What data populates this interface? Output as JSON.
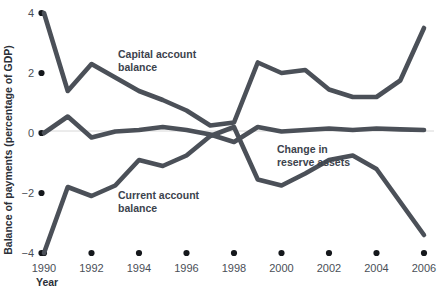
{
  "chart_data": {
    "type": "line",
    "title": "",
    "xlabel": "Year",
    "ylabel": "Balance of payments (percentage of GDP)",
    "xlim": [
      1990,
      2006
    ],
    "ylim": [
      -4,
      4
    ],
    "ytick_labels": [
      "4",
      "2",
      "0",
      "−2",
      "−4"
    ],
    "ytick_values": [
      4,
      2,
      0,
      -2,
      -4
    ],
    "xtick_labels": [
      "1990",
      "1992",
      "1994",
      "1996",
      "1998",
      "2000",
      "2002",
      "2004",
      "2006"
    ],
    "xtick_values": [
      1990,
      1992,
      1994,
      1996,
      1998,
      2000,
      2002,
      2004,
      2006
    ],
    "grid": false,
    "legend_position": "inline-annotations",
    "x": [
      1990,
      1991,
      1992,
      1993,
      1994,
      1995,
      1996,
      1997,
      1998,
      1999,
      2000,
      2001,
      2002,
      2003,
      2004,
      2005,
      2006
    ],
    "series": [
      {
        "name": "Capital account balance",
        "color": "#4b5058",
        "label_x": 1993.0,
        "label_y": 2.45,
        "values": [
          4.0,
          1.4,
          2.3,
          1.85,
          1.4,
          1.1,
          0.75,
          0.25,
          0.35,
          2.35,
          2.0,
          2.1,
          1.45,
          1.2,
          1.2,
          1.75,
          3.5
        ]
      },
      {
        "name": "Current account balance",
        "color": "#4b5058",
        "label_x": 1994.4,
        "label_y": -1.85,
        "values": [
          -4.0,
          -1.8,
          -2.1,
          -1.75,
          -0.9,
          -1.1,
          -0.75,
          -0.1,
          0.2,
          -1.55,
          -1.75,
          -1.35,
          -0.9,
          -0.75,
          -1.2,
          -2.3,
          -3.4
        ]
      },
      {
        "name": "Change in reserve assets",
        "color": "#4b5058",
        "label_x": 1999.6,
        "label_y": -0.55,
        "values": [
          0.0,
          0.55,
          -0.15,
          0.05,
          0.1,
          0.2,
          0.1,
          -0.05,
          -0.3,
          0.2,
          0.05,
          0.1,
          0.15,
          0.1,
          0.15,
          0.12,
          0.1
        ]
      }
    ],
    "annotations": [
      {
        "text_line1": "Capital account",
        "text_line2": "balance"
      },
      {
        "text_line1": "Current account",
        "text_line2": "balance"
      },
      {
        "text_line1": "Change in",
        "text_line2": "reserve assets"
      }
    ]
  },
  "colors": {
    "line": "#4b5058",
    "tick_text": "#4a4f57",
    "title_text": "#2b3038",
    "zero_line": "#d8d8d8",
    "background": "#ffffff"
  }
}
